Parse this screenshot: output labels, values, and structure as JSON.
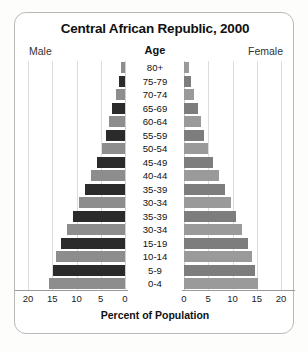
{
  "chart_data": {
    "type": "bar",
    "subtype": "population-pyramid",
    "title": "Central African Republic, 2000",
    "xlabel": "Percent of Population",
    "ylabel": "Age",
    "left_label": "Male",
    "right_label": "Female",
    "grid": true,
    "legend": "none",
    "xlim": [
      0,
      20
    ],
    "xticks": [
      20,
      15,
      10,
      5,
      0,
      0,
      5,
      10,
      15,
      20
    ],
    "categories": [
      "80+",
      "75-79",
      "70-74",
      "65-69",
      "60-64",
      "55-59",
      "50-54",
      "45-49",
      "40-44",
      "35-39",
      "30-34",
      "35-39",
      "30-34",
      "15-19",
      "10-14",
      "5-9",
      "0-4"
    ],
    "series": [
      {
        "name": "Male",
        "side": "left",
        "values": [
          0.8,
          1.3,
          1.9,
          2.6,
          3.3,
          4.0,
          4.8,
          5.8,
          7.0,
          8.3,
          9.5,
          10.7,
          12.0,
          13.2,
          14.2,
          14.9,
          15.7
        ]
      },
      {
        "name": "Female",
        "side": "right",
        "values": [
          1.0,
          1.5,
          2.1,
          2.8,
          3.5,
          4.2,
          5.0,
          6.0,
          7.2,
          8.4,
          9.6,
          10.8,
          12.0,
          13.1,
          14.0,
          14.7,
          15.3
        ]
      }
    ],
    "colors": {
      "bar_dark": "#2b2b2b",
      "bar_medium": "#8d8d8d",
      "bar_right": "#9a9a9a",
      "grid": "#dcdcdc",
      "axis": "#9a9a9a",
      "text": "#111111",
      "frame": "#b9b9b9",
      "background": "#ffffff"
    }
  }
}
